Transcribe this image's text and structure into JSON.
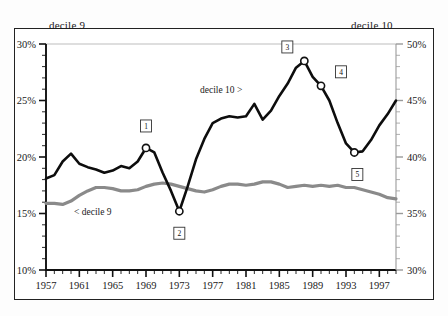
{
  "header": {
    "left_label": "decile 9",
    "right_label": "decile 10"
  },
  "annotations": {
    "decile10_label": "decile 10 >",
    "decile9_label": "< decile 9"
  },
  "chart_data": {
    "type": "line",
    "title": "",
    "xlabel": "",
    "ylabel": "",
    "grid": false,
    "legend_position": "inline",
    "xlim": [
      1957,
      1999
    ],
    "x_major_ticks": [
      1957,
      1961,
      1965,
      1969,
      1973,
      1977,
      1981,
      1985,
      1989,
      1993,
      1997
    ],
    "x_tick_labels": [
      "1957",
      "1961",
      "1965",
      "1969",
      "1973",
      "1977",
      "1981",
      "1985",
      "1989",
      "1993",
      "1997"
    ],
    "x_minor_interval": 1,
    "left_axis": {
      "label_for": "decile 9",
      "ylim": [
        10,
        30
      ],
      "major_ticks": [
        10,
        15,
        20,
        25,
        30
      ],
      "tick_labels": [
        "10%",
        "15%",
        "20%",
        "25%",
        "30%"
      ],
      "minor_interval": 1
    },
    "right_axis": {
      "label_for": "decile 10",
      "ylim": [
        30,
        50
      ],
      "major_ticks": [
        30,
        35,
        40,
        45,
        50
      ],
      "tick_labels": [
        "30%",
        "35%",
        "40%",
        "45%",
        "50%"
      ],
      "minor_interval": 1
    },
    "series": [
      {
        "name": "decile 10",
        "color": "#0d0d0d",
        "axis": "right",
        "x": [
          1957,
          1958,
          1959,
          1960,
          1961,
          1962,
          1963,
          1964,
          1965,
          1966,
          1967,
          1968,
          1969,
          1970,
          1971,
          1972,
          1973,
          1974,
          1975,
          1976,
          1977,
          1978,
          1979,
          1980,
          1981,
          1982,
          1983,
          1984,
          1985,
          1986,
          1987,
          1988,
          1989,
          1990,
          1991,
          1992,
          1993,
          1994,
          1995,
          1996,
          1997,
          1998,
          1999
        ],
        "values": [
          38.1,
          38.4,
          39.6,
          40.3,
          39.4,
          39.1,
          38.9,
          38.6,
          38.8,
          39.2,
          39.0,
          39.6,
          40.8,
          40.4,
          38.6,
          37.0,
          35.2,
          37.4,
          39.8,
          41.6,
          43.0,
          43.4,
          43.6,
          43.5,
          43.6,
          44.7,
          43.3,
          44.1,
          45.4,
          46.5,
          47.9,
          48.5,
          47.1,
          46.3,
          45.0,
          43.0,
          41.2,
          40.4,
          40.5,
          41.5,
          42.8,
          43.8,
          45.0
        ]
      },
      {
        "name": "decile 9",
        "color": "#8a8a8a",
        "axis": "left",
        "x": [
          1957,
          1958,
          1959,
          1960,
          1961,
          1962,
          1963,
          1964,
          1965,
          1966,
          1967,
          1968,
          1969,
          1970,
          1971,
          1972,
          1973,
          1974,
          1975,
          1976,
          1977,
          1978,
          1979,
          1980,
          1981,
          1982,
          1983,
          1984,
          1985,
          1986,
          1987,
          1988,
          1989,
          1990,
          1991,
          1992,
          1993,
          1994,
          1995,
          1996,
          1997,
          1998,
          1999
        ],
        "values": [
          15.9,
          15.9,
          15.8,
          16.1,
          16.6,
          17.0,
          17.3,
          17.3,
          17.2,
          17.0,
          17.0,
          17.1,
          17.4,
          17.6,
          17.7,
          17.6,
          17.4,
          17.2,
          17.0,
          16.9,
          17.1,
          17.4,
          17.6,
          17.6,
          17.5,
          17.6,
          17.8,
          17.8,
          17.6,
          17.3,
          17.4,
          17.5,
          17.4,
          17.5,
          17.4,
          17.5,
          17.3,
          17.3,
          17.1,
          16.9,
          16.7,
          16.4,
          16.3
        ]
      }
    ],
    "point_markers": [
      {
        "id": "1",
        "label": "1",
        "series": "decile 10",
        "x": 1969,
        "value": 40.8,
        "box_dx": 0,
        "box_dy": -22
      },
      {
        "id": "2",
        "label": "2",
        "series": "decile 10",
        "x": 1973,
        "value": 35.2,
        "box_dx": 0,
        "box_dy": 22
      },
      {
        "id": "3",
        "label": "3",
        "series": "decile 10",
        "x": 1988,
        "value": 48.5,
        "box_dx": -17,
        "box_dy": -14
      },
      {
        "id": "4",
        "label": "4",
        "series": "decile 10",
        "x": 1990,
        "value": 46.3,
        "box_dx": 20,
        "box_dy": -14
      },
      {
        "id": "5",
        "label": "5",
        "series": "decile 10",
        "x": 1994,
        "value": 40.4,
        "box_dx": 3,
        "box_dy": 22
      }
    ]
  }
}
